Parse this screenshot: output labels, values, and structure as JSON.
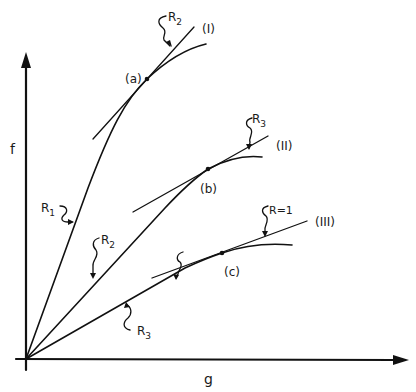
{
  "axes": {
    "y_label": "f",
    "x_label": "g"
  },
  "curves": [
    {
      "id": "I",
      "label": "(I)",
      "point_label": "(a)",
      "tangent_label": "R",
      "tangent_sub": "2",
      "ray_label": "R",
      "ray_sub": "1"
    },
    {
      "id": "II",
      "label": "(II)",
      "point_label": "(b)",
      "tangent_label": "R",
      "tangent_sub": "3",
      "ray_label": "R",
      "ray_sub": "2"
    },
    {
      "id": "III",
      "label": "(III)",
      "point_label": "(c)",
      "tangent_label": "R=1",
      "tangent_sub": "",
      "ray_label": "R",
      "ray_sub": "3"
    }
  ],
  "colors": {
    "ink": "#111111",
    "background": "#ffffff"
  }
}
